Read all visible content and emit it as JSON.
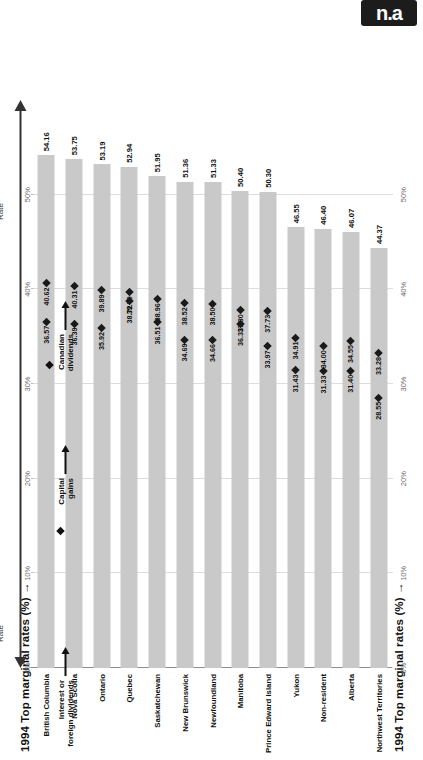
{
  "badge": {
    "text": "n.a"
  },
  "chart_data": {
    "type": "bar",
    "title": "",
    "xlabel": "1994 Top marginal rates (%)",
    "ylabel": "",
    "orientation": "horizontal",
    "xlim": [
      0,
      60
    ],
    "grid": true,
    "tick_labels": [
      "0%",
      "10%",
      "20%",
      "30%",
      "40%",
      "50%"
    ],
    "tick_values": [
      0,
      10,
      20,
      30,
      40,
      50
    ],
    "categories": [
      "British Columbia",
      "Nova Scotia",
      "Ontario",
      "Quebec",
      "Saskatchewan",
      "New Brunswick",
      "Newfoundland",
      "Manitoba",
      "Prince Edward Island",
      "Yukon",
      "Non-resident",
      "Alberta",
      "Northwest Territories"
    ],
    "series": [
      {
        "name": "Interest or foreign dividends",
        "marker": "bar",
        "values": [
          54.16,
          53.75,
          53.19,
          52.94,
          51.95,
          51.36,
          51.33,
          50.4,
          50.3,
          46.55,
          46.4,
          46.07,
          44.37
        ],
        "labels": [
          "54.16",
          "53.75",
          "53.19",
          "52.94",
          "51.95",
          "51.36",
          "51.33",
          "50.40",
          "50.30",
          "46.55",
          "46.40",
          "46.07",
          "44.37"
        ]
      },
      {
        "name": "Capital gains",
        "marker": "diamond",
        "values": [
          40.62,
          40.31,
          39.89,
          39.7,
          38.96,
          38.52,
          38.5,
          37.8,
          37.73,
          34.91,
          34.0,
          34.55,
          33.28
        ],
        "labels": [
          "40.62",
          "40.31",
          "39.89",
          "39.70",
          "38.96",
          "38.52",
          "38.50",
          "37.80",
          "37.73",
          "34.91",
          "34.00",
          "34.55",
          "33.28"
        ]
      },
      {
        "name": "Canadian dividends",
        "marker": "diamond",
        "values": [
          36.57,
          36.39,
          35.92,
          38.72,
          36.51,
          34.69,
          34.66,
          36.33,
          33.97,
          31.43,
          31.33,
          31.4,
          28.55
        ],
        "labels": [
          "36.57",
          "36.39",
          "35.92",
          "38.72",
          "36.51",
          "34.69",
          "34.66",
          "36.33",
          "33.97",
          "31.43",
          "31.33",
          "31.40",
          "28.55"
        ]
      }
    ],
    "legend_position": "left-callouts",
    "annotations": {
      "highest": "Highest\nTop\nMarginal\nRate",
      "lowest": "Lowest\nTop\nMarginal\nRate"
    }
  },
  "annotations": {
    "highest_line1": "Highest",
    "highest_line2": "Top",
    "highest_line3": "Marginal",
    "highest_line4": "Rate",
    "lowest_line1": "Lowest",
    "lowest_line2": "Top",
    "lowest_line3": "Marginal",
    "lowest_line4": "Rate"
  },
  "legend": {
    "interest": {
      "line1": "Interest or",
      "line2": "foreign dividends"
    },
    "capital": {
      "line1": "Capital",
      "line2": "gains"
    },
    "dividends": {
      "line1": "Canadian",
      "line2": "dividends"
    }
  },
  "axis": {
    "title_left": "1994 Top marginal rates (%) →",
    "title_right": "1994 Top marginal rates (%) →"
  },
  "colors": {
    "bar": "#c9c9c9",
    "marker": "#1a1a1a",
    "grid": "#b9b9b9",
    "text": "#111111",
    "badge": "#1c1c1c"
  }
}
